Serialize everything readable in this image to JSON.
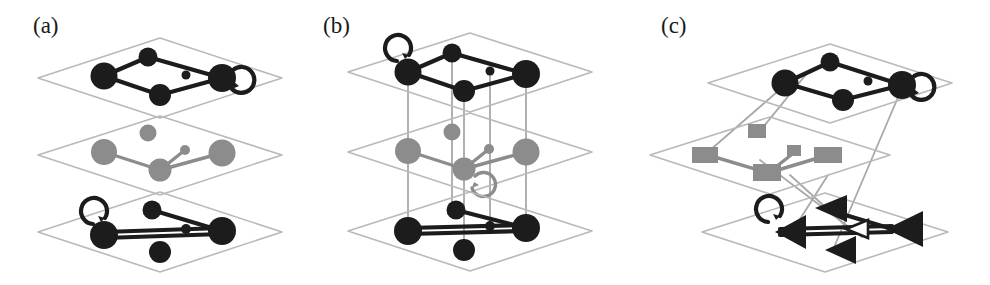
{
  "figure": {
    "width": 990,
    "height": 285,
    "background": "#ffffff"
  },
  "colors": {
    "layer_dark": "#1c1c1c",
    "layer_gray": "#8c8c8c",
    "plate_outline": "#b9b9b9",
    "interlayer_link": "#a8a8a8",
    "label_text": "#1a1a1a",
    "page_background": "#ffffff"
  },
  "panels": [
    {
      "id": "panel-a",
      "label": "(a)",
      "label_x": 33,
      "label_y": 14,
      "origin_x": 0,
      "interlayer_links": "none",
      "layers": [
        {
          "id": "layer-a-top",
          "index": 1,
          "node_shape": "circle",
          "color": "#1c1c1c",
          "plate_cx": 160,
          "plate_cy": 78,
          "has_self_loop": true,
          "self_loop_node": "right",
          "node_count": 5,
          "edge_count": 4
        },
        {
          "id": "layer-a-middle",
          "index": 2,
          "node_shape": "circle",
          "color": "#8c8c8c",
          "plate_cx": 160,
          "plate_cy": 155,
          "has_self_loop": false,
          "self_loop_node": "",
          "node_count": 5,
          "edge_count": 3
        },
        {
          "id": "layer-a-bottom",
          "index": 3,
          "node_shape": "circle",
          "color": "#1c1c1c",
          "plate_cx": 160,
          "plate_cy": 232,
          "has_self_loop": true,
          "self_loop_node": "left",
          "node_count": 5,
          "edge_count": 4
        }
      ]
    },
    {
      "id": "panel-b",
      "label": "(b)",
      "label_x": 323,
      "label_y": 14,
      "origin_x": 320,
      "interlayer_links": "vertical",
      "layers": [
        {
          "id": "layer-b-top",
          "index": 1,
          "node_shape": "circle",
          "color": "#1c1c1c",
          "plate_cx": 160,
          "plate_cy": 72,
          "has_self_loop": true,
          "self_loop_node": "left",
          "node_count": 5,
          "edge_count": 4
        },
        {
          "id": "layer-b-middle",
          "index": 2,
          "node_shape": "circle",
          "color": "#8c8c8c",
          "plate_cx": 160,
          "plate_cy": 152,
          "has_self_loop": true,
          "self_loop_node": "bottom-center",
          "node_count": 5,
          "edge_count": 3
        },
        {
          "id": "layer-b-bottom",
          "index": 3,
          "node_shape": "circle",
          "color": "#1c1c1c",
          "plate_cx": 160,
          "plate_cy": 231,
          "has_self_loop": false,
          "self_loop_node": "",
          "node_count": 5,
          "edge_count": 4
        }
      ]
    },
    {
      "id": "panel-c",
      "label": "(c)",
      "label_x": 21,
      "label_y": 14,
      "origin_x": 640,
      "interlayer_links": "diagonal",
      "layers": [
        {
          "id": "layer-c-top",
          "index": 1,
          "node_shape": "circle",
          "color": "#1c1c1c",
          "plate_cx": 190,
          "plate_cy": 80,
          "has_self_loop": true,
          "self_loop_node": "right",
          "node_count": 5,
          "edge_count": 4
        },
        {
          "id": "layer-c-middle",
          "index": 2,
          "node_shape": "square",
          "color": "#8c8c8c",
          "plate_cx": 130,
          "plate_cy": 155,
          "has_self_loop": false,
          "self_loop_node": "",
          "node_count": 5,
          "edge_count": 3
        },
        {
          "id": "layer-c-bottom",
          "index": 3,
          "node_shape": "triangle",
          "color": "#1c1c1c",
          "plate_cx": 185,
          "plate_cy": 232,
          "has_self_loop": true,
          "self_loop_node": "left",
          "node_count": 5,
          "edge_count": 4
        }
      ]
    }
  ]
}
